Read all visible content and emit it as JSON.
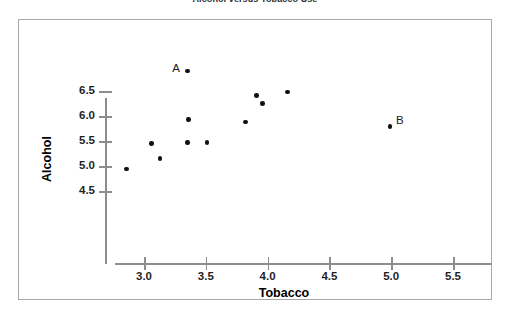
{
  "chart_data": {
    "type": "scatter",
    "title": "Alcohol versus Tobacco Use",
    "xlabel": "Tobacco",
    "ylabel": "Alcohol",
    "xlim": [
      2.6,
      5.75
    ],
    "ylim": [
      4.25,
      7.15
    ],
    "xticks": [
      "3.0",
      "3.5",
      "4.0",
      "4.5",
      "5.0",
      "5.5"
    ],
    "xtick_values": [
      3.0,
      3.5,
      4.0,
      4.5,
      5.0,
      5.5
    ],
    "yticks": [
      "4.5",
      "5.0",
      "5.5",
      "6.0",
      "6.5"
    ],
    "ytick_values": [
      4.5,
      5.0,
      5.5,
      6.0,
      6.5
    ],
    "grid": false,
    "legend": false,
    "points": [
      {
        "x": 2.86,
        "y": 4.94,
        "label": ""
      },
      {
        "x": 3.06,
        "y": 5.45,
        "label": ""
      },
      {
        "x": 3.13,
        "y": 5.15,
        "label": ""
      },
      {
        "x": 3.35,
        "y": 6.9,
        "label": "A"
      },
      {
        "x": 3.36,
        "y": 5.93,
        "label": ""
      },
      {
        "x": 3.35,
        "y": 5.47,
        "label": ""
      },
      {
        "x": 3.51,
        "y": 5.47,
        "label": ""
      },
      {
        "x": 3.82,
        "y": 5.88,
        "label": ""
      },
      {
        "x": 3.91,
        "y": 6.41,
        "label": ""
      },
      {
        "x": 3.96,
        "y": 6.25,
        "label": ""
      },
      {
        "x": 4.16,
        "y": 6.48,
        "label": ""
      },
      {
        "x": 4.99,
        "y": 5.79,
        "label": "B"
      }
    ],
    "annotations": [
      {
        "text": "A",
        "x": 3.35,
        "y": 6.9,
        "position": "left"
      },
      {
        "text": "B",
        "x": 4.99,
        "y": 5.79,
        "position": "right"
      }
    ],
    "colors": {
      "marker": "#111111",
      "axis": "#8d8d8d",
      "frame": "#a8a8a8",
      "text": "#1f1f1f",
      "background": "#ffffff"
    }
  }
}
